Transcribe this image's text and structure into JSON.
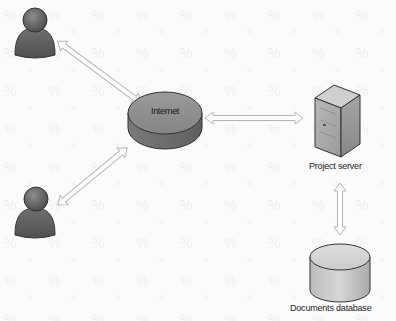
{
  "diagram": {
    "type": "network-architecture",
    "nodes": [
      {
        "id": "user-1",
        "kind": "user",
        "label": ""
      },
      {
        "id": "user-2",
        "kind": "user",
        "label": ""
      },
      {
        "id": "internet",
        "kind": "cloud-disc",
        "label": "Internet"
      },
      {
        "id": "project-server",
        "kind": "server",
        "label": "Project server"
      },
      {
        "id": "documents-database",
        "kind": "database",
        "label": "Documents database"
      }
    ],
    "edges": [
      {
        "from": "user-1",
        "to": "internet",
        "style": "double-arrow"
      },
      {
        "from": "user-2",
        "to": "internet",
        "style": "double-arrow"
      },
      {
        "from": "internet",
        "to": "project-server",
        "style": "double-arrow"
      },
      {
        "from": "project-server",
        "to": "documents-database",
        "style": "double-arrow"
      }
    ]
  },
  "colors": {
    "background": "#fbfbfb",
    "icon_dark": "#5a5a5a",
    "icon_mid": "#8a8a8a",
    "icon_light": "#c8c8c8",
    "arrow_fill": "#ffffff",
    "arrow_stroke": "#b5b5b5",
    "text": "#1a1a1a"
  }
}
